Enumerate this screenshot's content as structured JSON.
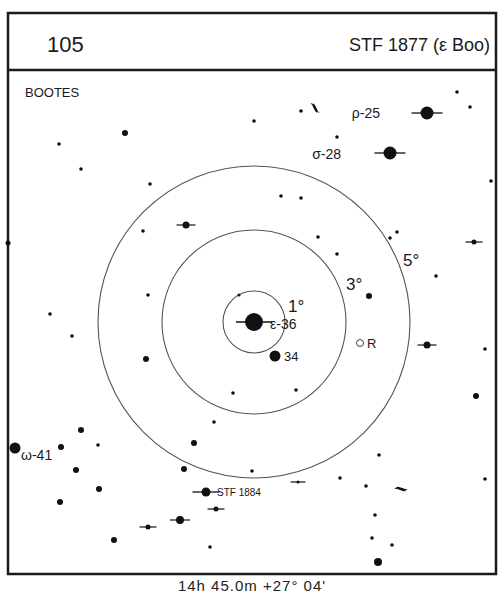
{
  "header": {
    "chart_number": "105",
    "object_name": "STF 1877 (ε Boo)"
  },
  "constellation": "BOOTES",
  "footer": {
    "coordinates": "14h 45.0m  +27° 04'"
  },
  "rings": {
    "center": [
      254,
      322
    ],
    "items": [
      {
        "label": "1°",
        "radius": 31,
        "label_pos": [
          288,
          312
        ]
      },
      {
        "label": "3°",
        "radius": 92,
        "label_pos": [
          346,
          290
        ]
      },
      {
        "label": "5°",
        "radius": 156,
        "label_pos": [
          403,
          266
        ]
      }
    ]
  },
  "colors": {
    "ink": "#111111",
    "ring": "#555555",
    "frame": "#1a1a1a",
    "background": "#ffffff"
  },
  "labeled_stars": [
    {
      "name": "epsilon",
      "label": "ε-36",
      "x": 254,
      "y": 322,
      "r": 9,
      "double": true,
      "label_pos": [
        270,
        329
      ]
    },
    {
      "name": "34",
      "label": "34",
      "x": 275,
      "y": 356,
      "r": 5.5,
      "double": false,
      "label_pos": [
        284,
        361
      ]
    },
    {
      "name": "rho",
      "label": "ρ-25",
      "x": 427,
      "y": 113,
      "r": 6.5,
      "double": true,
      "label_pos": [
        380,
        118
      ],
      "label_align": "end"
    },
    {
      "name": "sigma",
      "label": "σ-28",
      "x": 390,
      "y": 153,
      "r": 6.5,
      "double": true,
      "label_pos": [
        341,
        159
      ],
      "label_align": "end"
    },
    {
      "name": "omega",
      "label": "ω-41",
      "x": 15,
      "y": 448,
      "r": 5.5,
      "double": false,
      "label_pos": [
        21,
        460
      ]
    },
    {
      "name": "stf-1884",
      "label": "STF 1884",
      "x": 206,
      "y": 492,
      "r": 4.5,
      "double": true,
      "label_pos": [
        217,
        496
      ]
    },
    {
      "name": "variable-r",
      "label": "R",
      "x": 360,
      "y": 343,
      "r": 3.5,
      "variable": true,
      "label_pos": [
        367,
        348
      ]
    }
  ],
  "stars": [
    {
      "x": 125,
      "y": 133,
      "r": 3
    },
    {
      "x": 59,
      "y": 144,
      "r": 1.8
    },
    {
      "x": 81,
      "y": 169,
      "r": 1.8
    },
    {
      "x": 150,
      "y": 184,
      "r": 1.8
    },
    {
      "x": 254,
      "y": 121,
      "r": 1.8
    },
    {
      "x": 457,
      "y": 92,
      "r": 1.8
    },
    {
      "x": 470,
      "y": 107,
      "r": 1.8
    },
    {
      "x": 337,
      "y": 137,
      "r": 1.8
    },
    {
      "x": 491,
      "y": 181,
      "r": 1.8
    },
    {
      "x": 301,
      "y": 111,
      "r": 1.8
    },
    {
      "x": 8,
      "y": 243,
      "r": 2.5
    },
    {
      "x": 143,
      "y": 231,
      "r": 1.8
    },
    {
      "x": 281,
      "y": 196,
      "r": 1.8
    },
    {
      "x": 301,
      "y": 198,
      "r": 1.8
    },
    {
      "x": 318,
      "y": 237,
      "r": 1.8
    },
    {
      "x": 337,
      "y": 254,
      "r": 1.8
    },
    {
      "x": 390,
      "y": 238,
      "r": 1.8
    },
    {
      "x": 397,
      "y": 232,
      "r": 1.8
    },
    {
      "x": 436,
      "y": 276,
      "r": 1.8
    },
    {
      "x": 369,
      "y": 296,
      "r": 3
    },
    {
      "x": 148,
      "y": 295,
      "r": 1.8
    },
    {
      "x": 239,
      "y": 295,
      "r": 1.6
    },
    {
      "x": 50,
      "y": 314,
      "r": 1.8
    },
    {
      "x": 72,
      "y": 336,
      "r": 1.8
    },
    {
      "x": 146,
      "y": 359,
      "r": 3
    },
    {
      "x": 233,
      "y": 393,
      "r": 1.8
    },
    {
      "x": 296,
      "y": 390,
      "r": 1.8
    },
    {
      "x": 485,
      "y": 349,
      "r": 1.8
    },
    {
      "x": 476,
      "y": 396,
      "r": 3
    },
    {
      "x": 214,
      "y": 422,
      "r": 1.8
    },
    {
      "x": 194,
      "y": 443,
      "r": 3
    },
    {
      "x": 81,
      "y": 430,
      "r": 3
    },
    {
      "x": 61,
      "y": 447,
      "r": 3
    },
    {
      "x": 98,
      "y": 445,
      "r": 1.8
    },
    {
      "x": 76,
      "y": 470,
      "r": 3
    },
    {
      "x": 99,
      "y": 489,
      "r": 3
    },
    {
      "x": 60,
      "y": 502,
      "r": 3
    },
    {
      "x": 184,
      "y": 469,
      "r": 3
    },
    {
      "x": 252,
      "y": 471,
      "r": 1.8
    },
    {
      "x": 379,
      "y": 455,
      "r": 1.8
    },
    {
      "x": 340,
      "y": 478,
      "r": 1.8
    },
    {
      "x": 366,
      "y": 486,
      "r": 1.8
    },
    {
      "x": 485,
      "y": 479,
      "r": 1.8
    },
    {
      "x": 375,
      "y": 515,
      "r": 1.8
    },
    {
      "x": 372,
      "y": 538,
      "r": 1.8
    },
    {
      "x": 392,
      "y": 545,
      "r": 1.8
    },
    {
      "x": 378,
      "y": 562,
      "r": 4
    },
    {
      "x": 114,
      "y": 540,
      "r": 3
    },
    {
      "x": 210,
      "y": 547,
      "r": 1.8
    }
  ],
  "double_stars": [
    {
      "x": 186,
      "y": 225,
      "r": 3.5
    },
    {
      "x": 474,
      "y": 242,
      "r": 2.5
    },
    {
      "x": 427,
      "y": 345,
      "r": 3.5
    },
    {
      "x": 298,
      "y": 482,
      "r": 1.5
    },
    {
      "x": 216,
      "y": 509,
      "r": 2.5
    },
    {
      "x": 180,
      "y": 520,
      "r": 4
    },
    {
      "x": 148,
      "y": 527,
      "r": 2.5
    }
  ],
  "galaxies": [
    {
      "x": 315,
      "y": 108,
      "angle": 65
    },
    {
      "x": 401,
      "y": 489,
      "angle": 20
    }
  ]
}
